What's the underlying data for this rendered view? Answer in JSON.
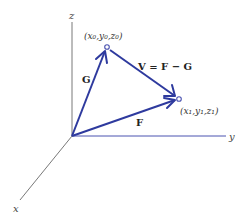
{
  "diagram": {
    "colors": {
      "vector": "#2e3a9e",
      "axis": "#555555",
      "y_axis": "#4a52b0",
      "point_fill": "#ffffff"
    },
    "axes": {
      "x": {
        "label": "x"
      },
      "y": {
        "label": "y"
      },
      "z": {
        "label": "z"
      }
    },
    "points": [
      {
        "id": "P0",
        "label": "(x₀,y₀,z₀)"
      },
      {
        "id": "P1",
        "label": "(x₁,y₁,z₁)"
      }
    ],
    "vectors": [
      {
        "id": "G",
        "label": "G",
        "from": "origin",
        "to": "P0"
      },
      {
        "id": "F",
        "label": "F",
        "from": "origin",
        "to": "P1"
      },
      {
        "id": "V",
        "label": "V = F − G",
        "from": "P0",
        "to": "P1"
      }
    ]
  }
}
